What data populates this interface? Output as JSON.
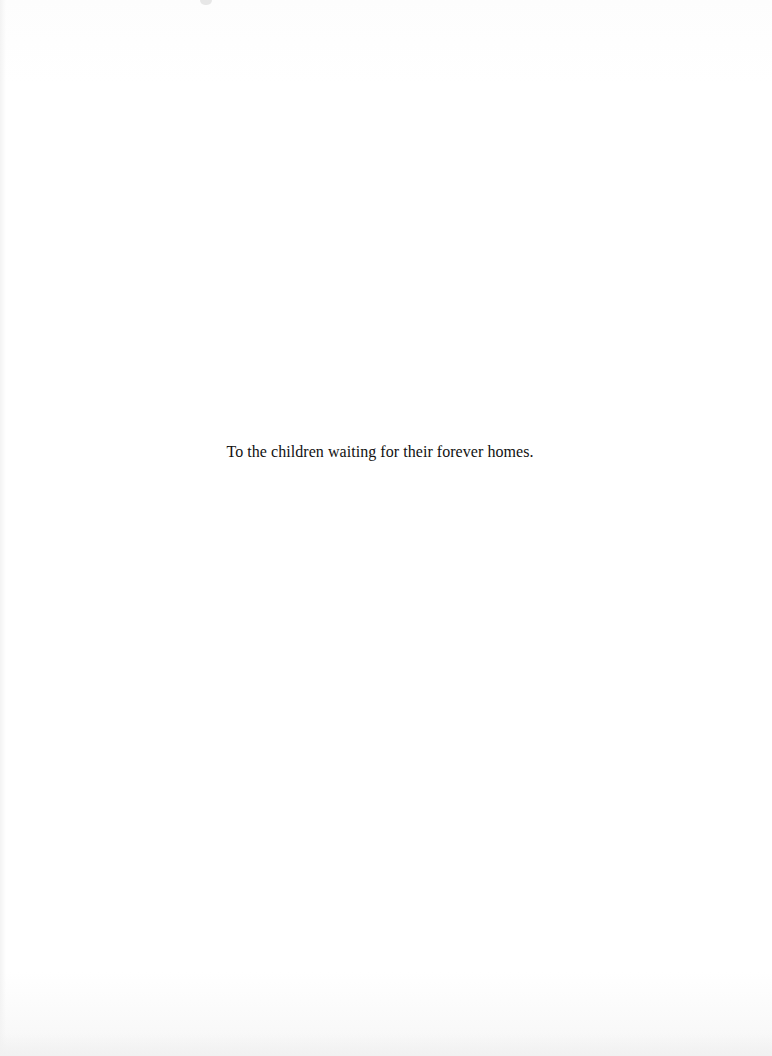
{
  "page": {
    "type": "dedication",
    "dedication_text": "To the children waiting for their forever homes."
  },
  "colors": {
    "paper": "#fefefe",
    "text": "#111111"
  }
}
